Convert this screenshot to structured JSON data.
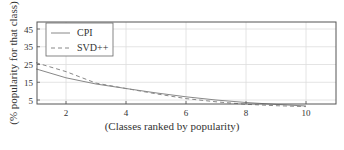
{
  "chart_data": {
    "type": "line",
    "title": "",
    "xlabel": "(Classes ranked by popularity)",
    "ylabel": "(%  popularity for that class)",
    "xlim": [
      1,
      11
    ],
    "ylim": [
      2.5,
      49
    ],
    "xticks": [
      2,
      4,
      6,
      8,
      10
    ],
    "yticks": [
      5,
      15,
      25,
      35,
      45
    ],
    "grid": true,
    "legend_position": "upper left",
    "x": [
      1,
      2,
      3,
      4,
      5,
      6,
      7,
      8,
      9,
      10
    ],
    "series": [
      {
        "name": "CPI",
        "style": "solid",
        "values": [
          22.5,
          17.5,
          14,
          11.5,
          9,
          6.8,
          5,
          3.6,
          2.5,
          1.6
        ]
      },
      {
        "name": "SVD++",
        "style": "dashed",
        "values": [
          26,
          21,
          14.5,
          11.5,
          8.5,
          5.8,
          4,
          2.6,
          1.8,
          1.3
        ]
      }
    ]
  },
  "legend": {
    "items": [
      {
        "label": "CPI"
      },
      {
        "label": "SVD++"
      }
    ]
  },
  "axes": {
    "xlabel": "(Classes ranked by popularity)",
    "ylabel": "(%  popularity for that class)",
    "xtick_labels": [
      "2",
      "4",
      "6",
      "8",
      "10"
    ],
    "ytick_labels": [
      "45",
      "35",
      "25",
      "15",
      "5"
    ]
  },
  "colors": {
    "line": "#888888",
    "grid": "#dddddd",
    "frame": "#555555"
  }
}
